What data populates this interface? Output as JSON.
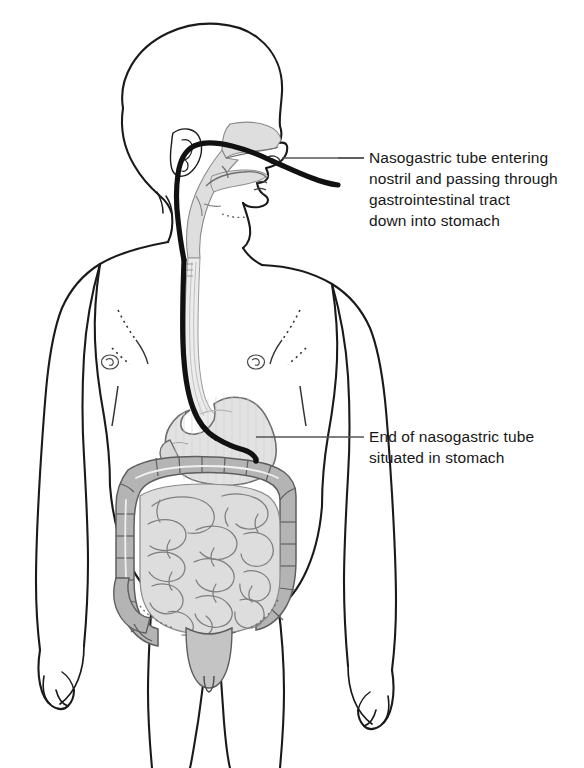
{
  "figure": {
    "background_color": "#ffffff",
    "outline_color": "#1a1a1a",
    "tube_color": "#111111"
  },
  "annotations": [
    {
      "id": "nasal",
      "text": "Nasogastric tube entering\nnostril and passing through\ngastrointestinal tract\ndown into stomach",
      "leader_color": "#555555"
    },
    {
      "id": "stomach",
      "text": "End of nasogastric tube\nsituated in stomach",
      "leader_color": "#555555"
    }
  ],
  "anatomy": {
    "body_outline": "child-torso-front-view",
    "head": "lateral-profile-facing-right",
    "structures": [
      {
        "name": "nasal-cavity",
        "fill": "#dedede"
      },
      {
        "name": "pharynx",
        "fill": "#dedede"
      },
      {
        "name": "esophagus",
        "fill": "#e8e8e8"
      },
      {
        "name": "stomach",
        "fill": "#e0e0e0"
      },
      {
        "name": "large-intestine-colon",
        "fill": "#b4b4b4"
      },
      {
        "name": "small-intestine",
        "fill": "#dddddd"
      },
      {
        "name": "rectum",
        "fill": "#c4c4c4"
      }
    ]
  },
  "colors": {
    "skin_outline": "#1a1a1a",
    "organ_light": "#e0e0e0",
    "organ_mid": "#b4b4b4",
    "organ_pale": "#dddddd",
    "tube": "#111111",
    "leader_line": "#555555",
    "text": "#171717"
  }
}
